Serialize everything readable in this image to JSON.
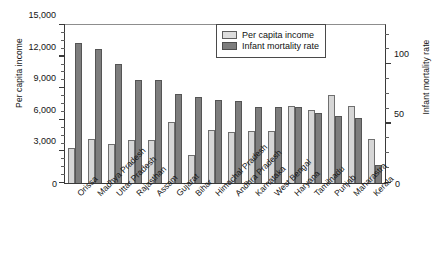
{
  "chart_data": {
    "type": "bar",
    "title": "",
    "xlabel": "",
    "ylabel": "Per capita income",
    "ylabel_right": "Infant mortality rate",
    "ylim": [
      0,
      15000
    ],
    "ylim_right": [
      0,
      133
    ],
    "grid": false,
    "legend_position": "top-right",
    "ytick_labels_left": [
      "15,000",
      "12,000",
      "9,000",
      "6,000",
      "3,000",
      "0"
    ],
    "ytick_values_left": [
      15000,
      12000,
      9000,
      6000,
      3000,
      0
    ],
    "ytick_labels_right": [
      "100",
      "50",
      "0"
    ],
    "ytick_values_right": [
      100,
      50,
      0
    ],
    "categories": [
      "Orissa",
      "Madhya Pradesh",
      "Uttar Pradesh",
      "Rajasthan",
      "Assam",
      "Gujarat",
      "Bihar",
      "Himachal Pradesh",
      "Andhra Pradesh",
      "Karnataka",
      "West Bengal",
      "Haryana",
      "Tamilnadu",
      "Punjab",
      "Maharastra",
      "Kerala"
    ],
    "series": [
      {
        "name": "Per capita income",
        "color": "#d6d6d6",
        "axis": "left",
        "values": [
          3300,
          4200,
          3700,
          4100,
          4100,
          5800,
          2700,
          5000,
          4800,
          4900,
          4900,
          7300,
          6900,
          8400,
          7300,
          4200
        ]
      },
      {
        "name": "Infant mortality rate",
        "color": "#7d7d7d",
        "axis": "right",
        "values": [
          118,
          113,
          100,
          87,
          87,
          75,
          72,
          70,
          69,
          64,
          64,
          64,
          59,
          56,
          55,
          15
        ]
      }
    ],
    "series_values_on_left_scale": [
      [
        3300,
        4200,
        3700,
        4100,
        4100,
        5800,
        2700,
        5000,
        4800,
        4900,
        4900,
        7300,
        6900,
        8400,
        7300,
        4200
      ],
      [
        13300,
        12750,
        11300,
        9800,
        9750,
        8450,
        8150,
        7900,
        7800,
        7250,
        7250,
        7250,
        6650,
        6350,
        6200,
        1700
      ]
    ]
  },
  "legend": {
    "items": [
      {
        "label": "Per capita income"
      },
      {
        "label": "Infant mortality rate"
      }
    ]
  }
}
